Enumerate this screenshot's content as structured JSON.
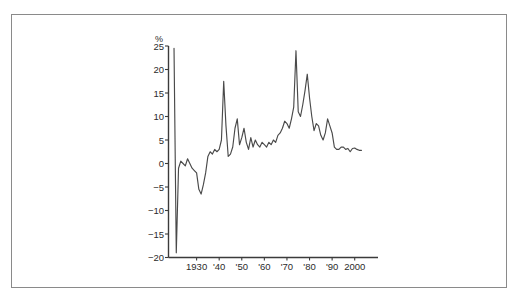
{
  "figure": {
    "border_color": "#8a8a8a",
    "background": "#ffffff",
    "axis_color": "#3b3b3b",
    "line_color": "#4a4a4a"
  },
  "chart_data": {
    "type": "line",
    "title": "",
    "subtitle": "",
    "xlabel": "",
    "ylabel": "",
    "unit_label": "%",
    "grid": false,
    "legend": "none",
    "xlim": [
      1918,
      2005
    ],
    "ylim": [
      -20,
      25
    ],
    "ytick_values": [
      -20,
      -15,
      -10,
      -5,
      0,
      5,
      10,
      15,
      20,
      25
    ],
    "ytick_labels": [
      "−20",
      "−15",
      "−10",
      "−5",
      "0",
      "5",
      "10",
      "15",
      "20",
      "25"
    ],
    "xtick_values": [
      1930,
      1940,
      1950,
      1960,
      1970,
      1980,
      1990,
      2000
    ],
    "xtick_labels": [
      "1930",
      "'40",
      "'50",
      "'60",
      "'70",
      "'80",
      "'90",
      "2000"
    ],
    "series": [
      {
        "name": "annual rate",
        "x": [
          1920,
          1921,
          1922,
          1923,
          1924,
          1925,
          1926,
          1927,
          1928,
          1929,
          1930,
          1931,
          1932,
          1933,
          1934,
          1935,
          1936,
          1937,
          1938,
          1939,
          1940,
          1941,
          1942,
          1943,
          1944,
          1945,
          1946,
          1947,
          1948,
          1949,
          1950,
          1951,
          1952,
          1953,
          1954,
          1955,
          1956,
          1957,
          1958,
          1959,
          1960,
          1961,
          1962,
          1963,
          1964,
          1965,
          1966,
          1967,
          1968,
          1969,
          1970,
          1971,
          1972,
          1973,
          1974,
          1975,
          1976,
          1977,
          1978,
          1979,
          1980,
          1981,
          1982,
          1983,
          1984,
          1985,
          1986,
          1987,
          1988,
          1989,
          1990,
          1991,
          1992,
          1993,
          1994,
          1995,
          1996,
          1997,
          1998,
          1999,
          2000,
          2001,
          2002,
          2003
        ],
        "values": [
          24.5,
          -19.0,
          -1.0,
          0.5,
          0.0,
          -0.5,
          1.0,
          0.0,
          -1.0,
          -1.5,
          -2.0,
          -5.5,
          -6.5,
          -4.5,
          -2.0,
          1.5,
          2.5,
          2.0,
          3.0,
          2.5,
          3.0,
          5.0,
          17.5,
          8.0,
          1.5,
          2.0,
          3.5,
          7.5,
          9.5,
          4.0,
          5.5,
          7.5,
          4.5,
          3.0,
          5.5,
          3.5,
          5.0,
          4.0,
          3.5,
          4.5,
          4.0,
          3.5,
          4.5,
          4.0,
          5.0,
          4.5,
          6.0,
          6.5,
          7.5,
          9.0,
          8.5,
          7.5,
          9.5,
          12.0,
          24.0,
          11.0,
          10.0,
          12.5,
          15.5,
          19.0,
          14.0,
          10.0,
          7.0,
          8.5,
          8.0,
          6.0,
          5.0,
          6.5,
          9.5,
          8.0,
          6.5,
          3.5,
          3.0,
          3.0,
          3.5,
          3.5,
          3.0,
          3.2,
          2.5,
          3.2,
          3.3,
          3.0,
          2.8,
          2.8
        ]
      }
    ]
  }
}
